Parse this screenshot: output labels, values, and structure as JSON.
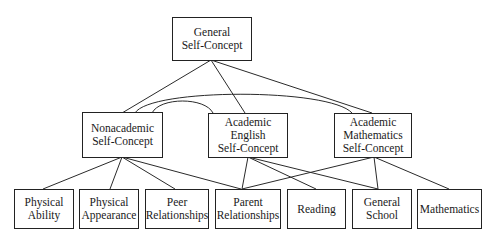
{
  "diagram": {
    "type": "hierarchy",
    "nodes": {
      "general": {
        "label": "General\nSelf-Concept"
      },
      "nonacademic": {
        "label": "Nonacademic\nSelf-Concept"
      },
      "academic_english": {
        "label": "Academic\nEnglish\nSelf-Concept"
      },
      "academic_math": {
        "label": "Academic\nMathematics\nSelf-Concept"
      },
      "physical_ability": {
        "label": "Physical\nAbility"
      },
      "physical_appearance": {
        "label": "Physical\nAppearance"
      },
      "peer_relationships": {
        "label": "Peer\nRelationships"
      },
      "parent_relationships": {
        "label": "Parent\nRelationships"
      },
      "reading": {
        "label": "Reading"
      },
      "general_school": {
        "label": "General\nSchool"
      },
      "mathematics": {
        "label": "Mathematics"
      }
    },
    "edges": [
      [
        "general",
        "nonacademic"
      ],
      [
        "general",
        "academic_english"
      ],
      [
        "general",
        "academic_math"
      ],
      [
        "nonacademic",
        "academic_english",
        "curved"
      ],
      [
        "nonacademic",
        "academic_math",
        "curved"
      ],
      [
        "nonacademic",
        "physical_ability"
      ],
      [
        "nonacademic",
        "physical_appearance"
      ],
      [
        "nonacademic",
        "peer_relationships"
      ],
      [
        "nonacademic",
        "parent_relationships"
      ],
      [
        "academic_english",
        "parent_relationships"
      ],
      [
        "academic_english",
        "reading"
      ],
      [
        "academic_english",
        "general_school"
      ],
      [
        "academic_math",
        "parent_relationships"
      ],
      [
        "academic_math",
        "general_school"
      ],
      [
        "academic_math",
        "mathematics"
      ]
    ]
  }
}
